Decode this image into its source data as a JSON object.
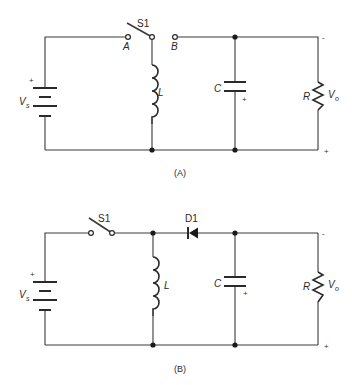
{
  "figure": {
    "background": "#ffffff",
    "line_color": "#2a2a2a"
  },
  "circuit_a": {
    "caption": "(A)",
    "source": {
      "label": "V",
      "subscript": "s",
      "plus": "+"
    },
    "switch": {
      "label": "S1",
      "terminal_a": "A",
      "terminal_b": "B"
    },
    "inductor": {
      "label": "L"
    },
    "capacitor": {
      "label": "C",
      "polarity": "+"
    },
    "resistor": {
      "label": "R"
    },
    "output": {
      "label": "V",
      "subscript": "o",
      "top_sign": "-",
      "bottom_sign": "+"
    }
  },
  "circuit_b": {
    "caption": "(B)",
    "source": {
      "label": "V",
      "subscript": "s",
      "plus": "+"
    },
    "switch": {
      "label": "S1"
    },
    "diode": {
      "label": "D1"
    },
    "inductor": {
      "label": "L"
    },
    "capacitor": {
      "label": "C",
      "polarity": "+"
    },
    "resistor": {
      "label": "R"
    },
    "output": {
      "label": "V",
      "subscript": "o",
      "top_sign": "-",
      "bottom_sign": "+"
    }
  }
}
